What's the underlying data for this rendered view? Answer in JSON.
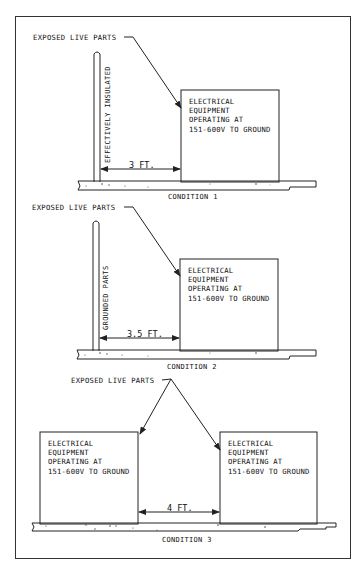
{
  "diagram": {
    "conditions": [
      {
        "id": 1,
        "caption": "CONDITION 1",
        "callout": "EXPOSED LIVE PARTS",
        "wall_label": "EFFECTIVELY INSULATED",
        "distance": "3 FT.",
        "equipment": {
          "line1": "ELECTRICAL",
          "line2": "EQUIPMENT",
          "line3": "OPERATING AT",
          "line4": "151-600V TO GROUND"
        }
      },
      {
        "id": 2,
        "caption": "CONDITION 2",
        "callout": "EXPOSED LIVE PARTS",
        "wall_label": "GROUNDED PARTS",
        "distance": "3.5 FT.",
        "equipment": {
          "line1": "ELECTRICAL",
          "line2": "EQUIPMENT",
          "line3": "OPERATING AT",
          "line4": "151-600V TO GROUND"
        }
      },
      {
        "id": 3,
        "caption": "CONDITION 3",
        "callout": "EXPOSED LIVE PARTS",
        "distance": "4 FT.",
        "equipment_left": {
          "line1": "ELECTRICAL",
          "line2": "EQUIPMENT",
          "line3": "OPERATING AT",
          "line4": "151-600V TO GROUND"
        },
        "equipment_right": {
          "line1": "ELECTRICAL",
          "line2": "EQUIPMENT",
          "line3": "OPERATING AT",
          "line4": "151-600V TO GROUND"
        }
      }
    ],
    "colors": {
      "line": "#222222",
      "background": "#ffffff"
    }
  }
}
